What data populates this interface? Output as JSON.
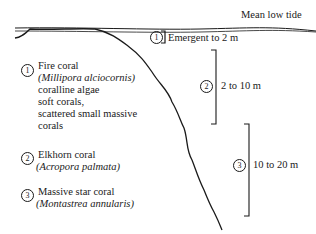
{
  "diagram": {
    "tide_label": "Mean low tide",
    "zones": [
      {
        "number": "1",
        "depth": "Emergent to 2 m"
      },
      {
        "number": "2",
        "depth": "2 to 10 m"
      },
      {
        "number": "3",
        "depth": "10 to 20 m"
      }
    ],
    "legend": [
      {
        "number": "1",
        "lines": [
          "Fire coral",
          "(Millipora alciocornis)",
          "coralline algae",
          "soft corals,",
          "scattered small massive",
          "corals"
        ]
      },
      {
        "number": "2",
        "lines": [
          "Elkhorn coral",
          "(Acropora palmata)"
        ]
      },
      {
        "number": "3",
        "lines": [
          "Massive star coral",
          "(Montastrea annularis)"
        ]
      }
    ],
    "colors": {
      "ink": "#1a1a1a",
      "background": "#ffffff"
    }
  }
}
